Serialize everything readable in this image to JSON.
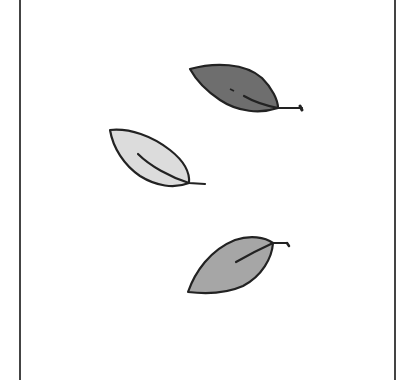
{
  "illustration": {
    "subject": "three falling leaves",
    "frame": {
      "border_color": "#444444",
      "background": "#ffffff"
    },
    "leaves": [
      {
        "id": "dark",
        "fill": "#6e6e6e",
        "stroke": "#222222"
      },
      {
        "id": "light",
        "fill": "#dcdcdc",
        "stroke": "#222222"
      },
      {
        "id": "medium",
        "fill": "#a6a6a6",
        "stroke": "#222222"
      }
    ]
  }
}
